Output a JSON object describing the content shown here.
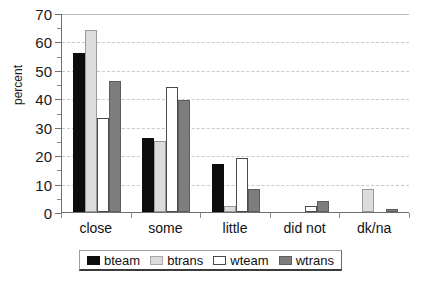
{
  "chart_data": {
    "type": "bar",
    "title": "",
    "xlabel": "",
    "ylabel": "percent",
    "ylim": [
      0,
      70
    ],
    "ytick_step": 10,
    "yticks": [
      0,
      10,
      20,
      30,
      40,
      50,
      60,
      70
    ],
    "grid": true,
    "grid_axis": "y",
    "legend_position": "bottom-center",
    "categories": [
      "close",
      "some",
      "little",
      "did not",
      "dk/na"
    ],
    "series": [
      {
        "name": "bteam",
        "color": "#0d0d0d",
        "values": [
          56,
          26,
          17,
          0,
          0
        ]
      },
      {
        "name": "btrans",
        "color": "#dcdcdc",
        "values": [
          64,
          25,
          2,
          0,
          8
        ]
      },
      {
        "name": "wteam",
        "color": "#ffffff",
        "values": [
          33,
          44,
          19,
          2,
          0
        ]
      },
      {
        "name": "wtrans",
        "color": "#7d7d7d",
        "values": [
          46,
          39.5,
          8,
          4,
          1
        ]
      }
    ]
  },
  "axis": {
    "y_title": "percent",
    "y_tick_labels": [
      "70",
      "60",
      "50",
      "40",
      "30",
      "20",
      "10",
      "0"
    ]
  },
  "legend": {
    "items": [
      {
        "label": "bteam",
        "key": "bteam"
      },
      {
        "label": "btrans",
        "key": "btrans"
      },
      {
        "label": "wteam",
        "key": "wteam"
      },
      {
        "label": "wtrans",
        "key": "wtrans"
      }
    ]
  }
}
